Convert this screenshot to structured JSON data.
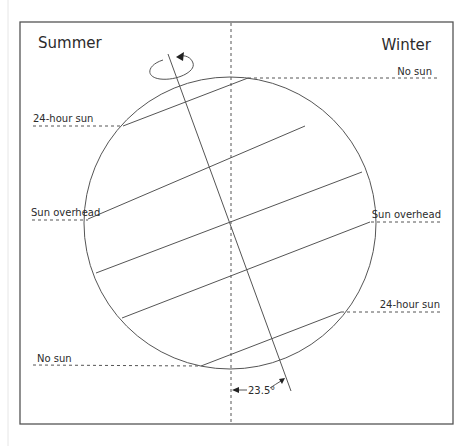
{
  "diagram": {
    "title_left": "Summer",
    "title_right": "Winter",
    "labels": {
      "top_right": "No sun",
      "upper_left": "24-hour sun",
      "mid_left": "Sun overhead",
      "mid_right": "Sun overhead",
      "lower_right": "24-hour sun",
      "bottom_left": "No sun",
      "tilt_angle": "23.5°"
    },
    "tilt_degrees": 23.5,
    "icons": {
      "rotation": "rotation-arrow-icon"
    }
  }
}
